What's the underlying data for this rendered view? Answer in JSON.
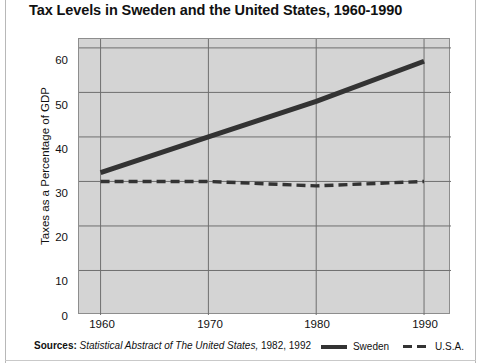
{
  "title": "Tax Levels in Sweden and the United States, 1960-1990",
  "y_axis_label": "Taxes as a Percentage of GDP",
  "sources": {
    "label": "Sources:",
    "publication": "Statistical Abstract of The United States,",
    "years": "1982, 1992"
  },
  "legend": {
    "items": [
      {
        "label": "Sweden",
        "style": "solid",
        "color": "#333333"
      },
      {
        "label": "U.S.A.",
        "style": "dashed",
        "color": "#333333"
      }
    ]
  },
  "colors": {
    "plot_background": "#d4d4d4",
    "gridline": "#6f6f6f",
    "axis": "#8d8d8d",
    "series": "#333333",
    "text": "#111111",
    "page_background": "#ffffff"
  },
  "chart_data": {
    "type": "line",
    "title": "Tax Levels in Sweden and the United States, 1960-1990",
    "xlabel": "",
    "ylabel": "Taxes as a Percentage of GDP",
    "x": [
      1960,
      1970,
      1980,
      1990
    ],
    "xlim": [
      1958,
      1992.5
    ],
    "ylim": [
      0,
      62
    ],
    "yticks": [
      0,
      10,
      20,
      30,
      40,
      50,
      60
    ],
    "xticks": [
      1960,
      1970,
      1980,
      1990
    ],
    "grid": true,
    "legend_position": "bottom-right",
    "series": [
      {
        "name": "Sweden",
        "style": "solid",
        "color": "#333333",
        "values": [
          32,
          40,
          48,
          57
        ]
      },
      {
        "name": "U.S.A.",
        "style": "dashed",
        "color": "#333333",
        "values": [
          30,
          30,
          29,
          30
        ]
      }
    ]
  }
}
